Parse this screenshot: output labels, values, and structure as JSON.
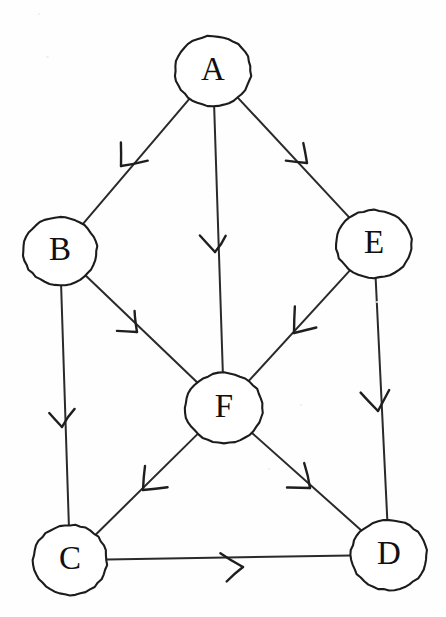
{
  "figure": {
    "background_color": "#fefefe",
    "ink_color": "#1c1c1c",
    "width": 446,
    "height": 617
  },
  "chart_data": {
    "type": "diagram",
    "subtype": "directed-graph",
    "title": "",
    "nodes": [
      {
        "id": "A",
        "label": "A",
        "cx": 213,
        "cy": 71,
        "rx": 38,
        "ry": 35
      },
      {
        "id": "B",
        "label": "B",
        "cx": 60,
        "cy": 251,
        "rx": 37,
        "ry": 34
      },
      {
        "id": "E",
        "label": "E",
        "cx": 374,
        "cy": 244,
        "rx": 38,
        "ry": 34
      },
      {
        "id": "F",
        "label": "F",
        "cx": 224,
        "cy": 408,
        "rx": 39,
        "ry": 35
      },
      {
        "id": "C",
        "label": "C",
        "cx": 70,
        "cy": 560,
        "rx": 37,
        "ry": 35
      },
      {
        "id": "D",
        "label": "D",
        "cx": 389,
        "cy": 555,
        "rx": 38,
        "ry": 35
      }
    ],
    "edges": [
      {
        "from": "A",
        "to": "B",
        "directed": true,
        "arrow_at": [
          121,
          166
        ]
      },
      {
        "from": "A",
        "to": "F",
        "directed": true,
        "arrow_at": [
          215,
          252
        ]
      },
      {
        "from": "A",
        "to": "E",
        "directed": true,
        "arrow_at": [
          307,
          163
        ]
      },
      {
        "from": "B",
        "to": "F",
        "directed": true,
        "arrow_at": [
          137,
          332
        ]
      },
      {
        "from": "B",
        "to": "C",
        "directed": true,
        "arrow_at": [
          62,
          427
        ]
      },
      {
        "from": "E",
        "to": "F",
        "directed": true,
        "arrow_at": [
          294,
          333
        ]
      },
      {
        "from": "E",
        "to": "D",
        "directed": true,
        "arrow_at": [
          378,
          411
        ]
      },
      {
        "from": "F",
        "to": "C",
        "directed": true,
        "arrow_at": [
          143,
          490
        ]
      },
      {
        "from": "F",
        "to": "D",
        "directed": true,
        "arrow_at": [
          310,
          488
        ]
      },
      {
        "from": "C",
        "to": "D",
        "directed": true,
        "arrow_at": [
          243,
          567
        ]
      }
    ],
    "node_count": 6,
    "edge_count": 10,
    "legend": [],
    "annotations": []
  }
}
